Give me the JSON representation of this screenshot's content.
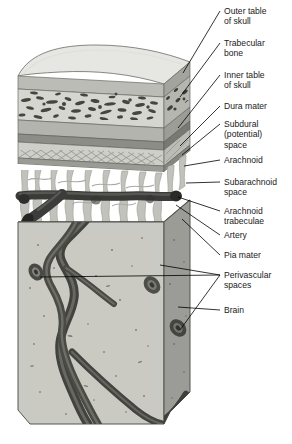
{
  "figure": {
    "background_color": "#ffffff",
    "labels": [
      {
        "id": "outer-table-of-skull",
        "text": "Outer table\nof skull",
        "x": 224,
        "y": 6,
        "anchor_x": 183,
        "anchor_y": 73
      },
      {
        "id": "trabecular-bone",
        "text": "Trabecular\nbone",
        "x": 224,
        "y": 38,
        "anchor_x": 180,
        "anchor_y": 97
      },
      {
        "id": "inner-table-of-skull",
        "text": "Inner table\nof skull",
        "x": 224,
        "y": 70,
        "anchor_x": 178,
        "anchor_y": 128
      },
      {
        "id": "dura-mater",
        "text": "Dura mater",
        "x": 224,
        "y": 101,
        "anchor_x": 180,
        "anchor_y": 146
      },
      {
        "id": "subdural-space",
        "text": "Subdural\n(potential)\nspace",
        "x": 224,
        "y": 119,
        "anchor_x": 182,
        "anchor_y": 155
      },
      {
        "id": "arachnoid",
        "text": "Arachnoid",
        "x": 224,
        "y": 155,
        "anchor_x": 184,
        "anchor_y": 166
      },
      {
        "id": "subarachnoid-space",
        "text": "Subarachnoid\nspace",
        "x": 224,
        "y": 177,
        "anchor_x": 186,
        "anchor_y": 183
      },
      {
        "id": "arachnoid-trabeculae",
        "text": "Arachnoid\ntrabeculae",
        "x": 224,
        "y": 206,
        "anchor_x": 178,
        "anchor_y": 197
      },
      {
        "id": "artery",
        "text": "Artery",
        "x": 224,
        "y": 230,
        "anchor_x": 176,
        "anchor_y": 205
      },
      {
        "id": "pia-mater",
        "text": "Pia mater",
        "x": 224,
        "y": 250,
        "anchor_x": 182,
        "anchor_y": 219
      },
      {
        "id": "perivascular-spaces",
        "text": "Perivascular\nspaces",
        "x": 224,
        "y": 270,
        "anchor_x": 160,
        "anchor_y": 265
      },
      {
        "id": "brain",
        "text": "Brain",
        "x": 224,
        "y": 305,
        "anchor_x": 178,
        "anchor_y": 307
      }
    ],
    "structures": {
      "skull_top_surface": "Outer table of skull (curved top face)",
      "outer_table": "Outer table compact bone band",
      "trabecular_bone": "Trabecular (cancellous) bone with marrow spaces",
      "inner_table": "Inner table compact bone band",
      "dura_mater": "Dura mater",
      "subdural_space": "Subdural (potential) space",
      "arachnoid": "Arachnoid membrane",
      "subarachnoid_space": "Subarachnoid space containing trabeculae and artery",
      "arachnoid_trabeculae": "Arachnoid trabeculae strands",
      "artery": "Cortical artery branching into brain",
      "pia_mater": "Pia mater covering brain surface",
      "brain": "Brain parenchyma block",
      "perivascular_spaces": "Perivascular (Virchow-Robin) spaces around vessels"
    },
    "colors": {
      "skull_top": "#e3e3e1",
      "outer_table": "#b9b9b4",
      "trabecular_fill": "#d2d2ce",
      "trabecular_speckle": "#4a4a46",
      "inner_table": "#b0b0ab",
      "dura": "#8f8f8a",
      "arachnoid": "#c9c9c4",
      "subarachnoid": "#ffffff",
      "trabeculae": "#a8a8a2",
      "artery_dark": "#3c3c3a",
      "brain_front": "#c6c6c0",
      "brain_side": "#9a9a95",
      "outline": "#55554f",
      "label_text": "#1a1a1a",
      "leader_line": "#000000"
    }
  }
}
